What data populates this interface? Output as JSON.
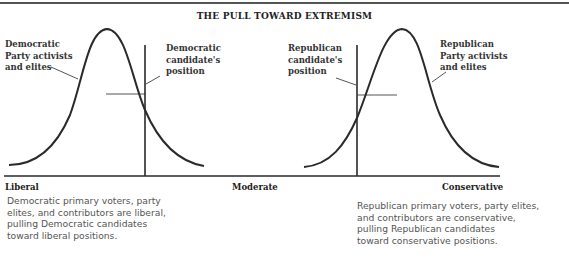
{
  "figure": {
    "title": "THE PULL TOWARD EXTREMISM",
    "axis": {
      "left_label": "Liberal",
      "center_label": "Moderate",
      "right_label": "Conservative"
    },
    "democratic": {
      "curve_label": "Democratic\nParty activists\nand elites",
      "candidate_label": "Democratic\ncandidate's\nposition",
      "caption": "Democratic primary voters, party\nelites, and contributors are liberal,\npulling Democratic candidates\ntoward liberal positions."
    },
    "republican": {
      "curve_label": "Republican\nParty activists\nand elites",
      "candidate_label": "Republican\ncandidate's\nposition",
      "caption": "Republican primary voters, party elites,\nand contributors are conservative,\npulling Republican candidates\ntoward conservative positions."
    }
  },
  "colors": {
    "line": "#2a2a2a",
    "rule": "#555555",
    "text_bold": "#333333",
    "caption": "#555555"
  }
}
